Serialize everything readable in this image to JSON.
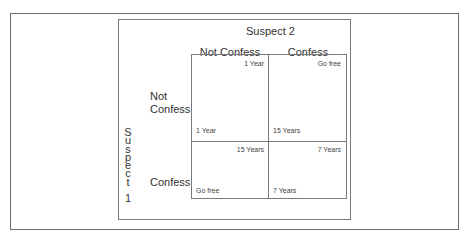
{
  "diagram": {
    "title_suspect2": "Suspect 2",
    "title_suspect1_letters": [
      "S",
      "u",
      "s",
      "p",
      "e",
      "c",
      "t",
      "",
      "1"
    ],
    "title_suspect1": "Suspect 1",
    "columns": [
      "Not Confess",
      "Confess"
    ],
    "rows": [
      {
        "label_line1": "Not",
        "label_line2": "Confess"
      },
      {
        "label_line1": "Confess",
        "label_line2": ""
      }
    ],
    "cells": [
      [
        {
          "top_right": "1 Year",
          "bottom_left": "1 Year"
        },
        {
          "top_right": "Go free",
          "bottom_left": "15 Years"
        }
      ],
      [
        {
          "top_right": "15 Years",
          "bottom_left": "Go free"
        },
        {
          "top_right": "7 Years",
          "bottom_left": "7 Years"
        }
      ]
    ]
  }
}
